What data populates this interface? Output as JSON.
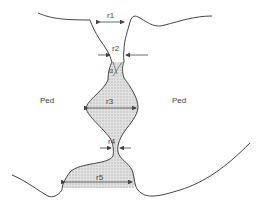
{
  "diagram": {
    "labels": {
      "left_region": "Ped",
      "right_region": "Ped",
      "r1": "r",
      "r1_sub": "1",
      "r2": "r",
      "r2_sub": "2",
      "alpha": "α",
      "r3": "r",
      "r3_sub": "3",
      "r4": "r",
      "r4_sub": "4",
      "r5": "r",
      "r5_sub": "5"
    },
    "colors": {
      "stroke": "#444444",
      "fill": "#d6d6d6",
      "text": "#444444"
    }
  }
}
